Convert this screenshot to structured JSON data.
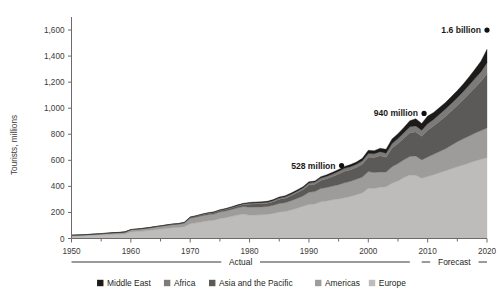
{
  "chart_data": {
    "type": "area",
    "stacked": true,
    "title": "",
    "subtitle": "",
    "xlabel": "",
    "ylabel": "Tourists, millions",
    "xlim": [
      1950,
      2020
    ],
    "ylim": [
      0,
      1700
    ],
    "y_ticks": [
      "0",
      "200",
      "400",
      "600",
      "800",
      "1,000",
      "1,200",
      "1,400",
      "1,600"
    ],
    "y_tick_values": [
      0,
      200,
      400,
      600,
      800,
      1000,
      1200,
      1400,
      1600
    ],
    "x_ticks": [
      "1950",
      "1960",
      "1970",
      "1980",
      "1990",
      "2000",
      "2010",
      "2020"
    ],
    "x_tick_values": [
      1950,
      1960,
      1970,
      1980,
      1990,
      2000,
      2010,
      2020
    ],
    "x_minor_ticks": [
      1955,
      1965,
      1975,
      1985,
      1995,
      2005,
      2015
    ],
    "grid": false,
    "legend_position": "bottom",
    "x": [
      1950,
      1951,
      1952,
      1953,
      1954,
      1955,
      1956,
      1957,
      1958,
      1959,
      1960,
      1961,
      1962,
      1963,
      1964,
      1965,
      1966,
      1967,
      1968,
      1969,
      1970,
      1971,
      1972,
      1973,
      1974,
      1975,
      1976,
      1977,
      1978,
      1979,
      1980,
      1981,
      1982,
      1983,
      1984,
      1985,
      1986,
      1987,
      1988,
      1989,
      1990,
      1991,
      1992,
      1993,
      1994,
      1995,
      1996,
      1997,
      1998,
      1999,
      2000,
      2001,
      2002,
      2003,
      2004,
      2005,
      2006,
      2007,
      2008,
      2009,
      2010,
      2011,
      2012,
      2013,
      2014,
      2015,
      2016,
      2017,
      2018,
      2019,
      2020
    ],
    "series": [
      {
        "name": "Europe",
        "color": "#bdbcbb",
        "values": [
          16.8,
          18.5,
          19.9,
          21.3,
          23.4,
          26.0,
          28.0,
          31.0,
          32.0,
          35.0,
          50.4,
          53.0,
          57.0,
          61.0,
          67.0,
          72.0,
          77.0,
          82.0,
          84.0,
          91.0,
          113.0,
          120.0,
          129.0,
          136.0,
          140.0,
          153.9,
          160.0,
          170.0,
          180.0,
          188.0,
          178.5,
          180.0,
          182.0,
          185.0,
          192.0,
          204.3,
          207.0,
          219.0,
          233.0,
          248.0,
          261.5,
          265.0,
          282.0,
          288.0,
          297.0,
          304.1,
          313.0,
          322.0,
          336.0,
          350.0,
          385.6,
          383.8,
          394.2,
          396.6,
          424.4,
          441.5,
          468.4,
          487.3,
          485.2,
          461.7,
          475.3,
          490.0,
          505.0,
          520.0,
          535.0,
          550.0,
          565.0,
          580.0,
          595.0,
          608.0,
          620.0
        ]
      },
      {
        "name": "Americas",
        "color": "#9d9c9b",
        "values": [
          7.5,
          8.0,
          8.6,
          9.2,
          9.9,
          10.5,
          11.3,
          12.0,
          12.7,
          13.5,
          16.7,
          17.5,
          18.4,
          19.4,
          20.5,
          21.6,
          22.9,
          24.1,
          25.2,
          26.8,
          42.3,
          43.8,
          45.5,
          47.2,
          48.5,
          50.0,
          51.8,
          53.3,
          55.4,
          57.6,
          62.3,
          62.0,
          60.5,
          59.8,
          62.5,
          64.3,
          67.5,
          71.0,
          74.8,
          79.0,
          92.8,
          95.3,
          102.0,
          102.8,
          105.0,
          109.0,
          114.5,
          116.6,
          119.5,
          122.2,
          128.2,
          122.1,
          116.6,
          113.1,
          125.7,
          133.3,
          135.8,
          142.9,
          148.0,
          141.7,
          150.2,
          156.0,
          162.8,
          168.0,
          181.0,
          192.0,
          200.0,
          207.0,
          214.0,
          220.0,
          228.0
        ]
      },
      {
        "name": "Asia and the Pacific",
        "color": "#5c5a58",
        "values": [
          0.2,
          0.3,
          0.3,
          0.4,
          0.5,
          0.5,
          0.6,
          0.7,
          0.8,
          0.9,
          0.9,
          1.0,
          1.2,
          1.4,
          1.6,
          1.9,
          2.2,
          2.6,
          2.9,
          3.3,
          6.2,
          7.0,
          8.0,
          9.0,
          9.8,
          10.2,
          11.5,
          12.8,
          14.0,
          15.5,
          23.0,
          24.0,
          25.0,
          26.0,
          28.0,
          32.9,
          35.0,
          38.5,
          43.0,
          47.0,
          55.8,
          57.0,
          62.0,
          68.0,
          74.0,
          82.4,
          89.0,
          89.5,
          88.8,
          97.6,
          110.1,
          115.7,
          124.9,
          113.3,
          144.2,
          154.6,
          166.0,
          182.0,
          184.1,
          180.9,
          205.4,
          218.0,
          233.0,
          249.0,
          263.0,
          279.0,
          300.0,
          325.0,
          350.0,
          378.0,
          416.0
        ]
      },
      {
        "name": "Africa",
        "color": "#7d7b79",
        "values": [
          0.5,
          0.5,
          0.6,
          0.6,
          0.7,
          0.8,
          0.9,
          1.0,
          1.1,
          1.2,
          0.8,
          0.9,
          1.0,
          1.1,
          1.2,
          1.4,
          1.6,
          1.7,
          1.9,
          2.1,
          2.4,
          2.6,
          2.9,
          3.2,
          3.4,
          3.7,
          4.0,
          4.3,
          4.7,
          5.1,
          7.2,
          7.5,
          7.8,
          8.2,
          8.8,
          9.7,
          10.2,
          11.0,
          12.0,
          13.5,
          15.2,
          16.0,
          17.5,
          18.5,
          19.6,
          20.4,
          21.9,
          23.0,
          25.0,
          26.5,
          28.3,
          29.1,
          30.2,
          31.8,
          34.3,
          37.3,
          41.5,
          45.0,
          47.0,
          46.0,
          50.4,
          49.5,
          53.0,
          56.0,
          58.0,
          60.0,
          63.0,
          66.0,
          70.0,
          74.0,
          85.0
        ]
      },
      {
        "name": "Middle East",
        "color": "#1c1b1a",
        "values": [
          0.2,
          0.2,
          0.2,
          0.3,
          0.3,
          0.3,
          0.4,
          0.4,
          0.5,
          0.5,
          0.6,
          0.7,
          0.7,
          0.8,
          0.9,
          1.0,
          1.1,
          1.2,
          1.3,
          1.5,
          1.9,
          2.1,
          2.4,
          2.7,
          2.9,
          3.2,
          3.5,
          3.8,
          4.2,
          4.6,
          6.0,
          6.3,
          6.6,
          7.0,
          7.5,
          8.0,
          8.5,
          9.1,
          9.8,
          10.5,
          9.6,
          8.5,
          11.0,
          12.0,
          13.0,
          13.7,
          15.0,
          16.0,
          17.5,
          19.0,
          24.9,
          23.6,
          27.0,
          30.0,
          36.0,
          37.8,
          40.9,
          46.6,
          55.2,
          52.9,
          58.2,
          54.0,
          52.0,
          50.0,
          52.0,
          54.0,
          58.0,
          64.0,
          72.0,
          82.0,
          103.0
        ]
      }
    ],
    "annotations": [
      {
        "label": "528 million",
        "year": 1995,
        "value": 528,
        "point_x": 1995.5,
        "point_y": 560
      },
      {
        "label": "940 million",
        "year": 2010,
        "value": 940,
        "point_x": 2009.4,
        "point_y": 960
      },
      {
        "label": "1.6 billion",
        "year": 2020,
        "value": 1600,
        "point_x": 2020,
        "point_y": 1600
      }
    ],
    "period_brackets": [
      {
        "label": "Actual",
        "start": 1950,
        "end": 2007
      },
      {
        "label": "Forecast",
        "start": 2009,
        "end": 2020
      }
    ]
  },
  "legend": {
    "items": [
      {
        "label": "Middle East",
        "color": "#1c1b1a"
      },
      {
        "label": "Africa",
        "color": "#7d7b79"
      },
      {
        "label": "Asia and the Pacific",
        "color": "#5c5a58"
      },
      {
        "label": "Americas",
        "color": "#9d9c9b"
      },
      {
        "label": "Europe",
        "color": "#bdbcbb"
      }
    ]
  },
  "axes": {
    "y_title": "Tourists, millions",
    "y_tick_labels": [
      "1,600",
      "1,400",
      "1,200",
      "1,000",
      "800",
      "600",
      "400",
      "200",
      "0"
    ],
    "x_tick_labels": [
      "1950",
      "1960",
      "1970",
      "1980",
      "1990",
      "2000",
      "2010",
      "2020"
    ]
  },
  "periods": {
    "actual_label": "Actual",
    "forecast_label": "Forecast"
  },
  "annotation_labels": {
    "a0": "528 million",
    "a1": "940 million",
    "a2": "1.6 billion"
  }
}
